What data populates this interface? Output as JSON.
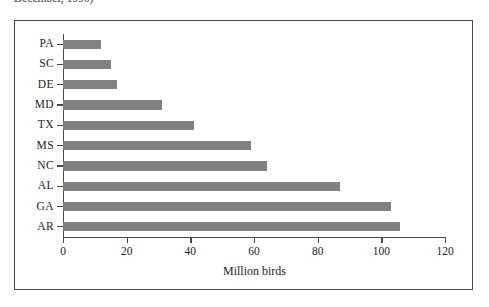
{
  "caption": {
    "text": "December, 1996)"
  },
  "chart_data": {
    "type": "bar",
    "orientation": "horizontal",
    "title": "",
    "xlabel": "Million birds",
    "ylabel": "",
    "categories": [
      "PA",
      "SC",
      "DE",
      "MD",
      "TX",
      "MS",
      "NC",
      "AL",
      "GA",
      "AR"
    ],
    "values": [
      12,
      15,
      17,
      31,
      41,
      59,
      64,
      87,
      103,
      106
    ],
    "xlim": [
      0,
      120
    ],
    "xticks": [
      0,
      20,
      40,
      60,
      80,
      100,
      120
    ],
    "xtick_labels": [
      "0",
      "20",
      "40",
      "60",
      "80",
      "100",
      "120"
    ],
    "grid": false,
    "legend": false,
    "bar_color": "#818181",
    "axis_color": "#4a4a4a",
    "frame_color": "#4a4a4a",
    "text_color": "#1d1d1d"
  }
}
